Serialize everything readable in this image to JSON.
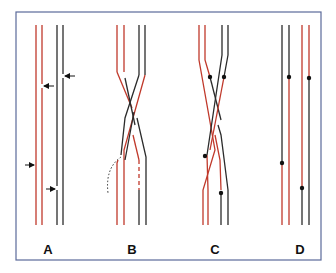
{
  "figure": {
    "frame_color": "#5b6a9a",
    "colors": {
      "red": "#c0392b",
      "black": "#2b2b2b"
    },
    "panels": [
      {
        "id": "A",
        "label": "A",
        "description": "Two parallel red lines and two parallel black lines with arrows marking nicks"
      },
      {
        "id": "B",
        "label": "B",
        "description": "Strands crossing over with a dotted displaced segment and dashed gap"
      },
      {
        "id": "C",
        "label": "C",
        "description": "Crossed strands with dots marking ligation/nick points"
      },
      {
        "id": "D",
        "label": "D",
        "description": "Resolved parallel strands with exchanged segments marked by dots"
      }
    ]
  }
}
